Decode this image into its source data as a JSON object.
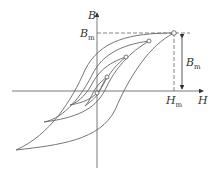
{
  "diagram": {
    "type": "nested hysteresis loops (B-H curve)",
    "axes": {
      "x_label": "H",
      "y_label": "B"
    },
    "labels": {
      "B": "B",
      "H": "H",
      "Bm_left": "B",
      "Bm_left_sub": "m",
      "Bm_right": "B",
      "Bm_right_sub": "m",
      "Hm": "H",
      "Hm_sub": "m"
    },
    "colors": {
      "stroke": "#555555",
      "text": "#333333"
    },
    "loop_tips": [
      [
        174,
        33
      ],
      [
        149,
        41
      ],
      [
        126,
        57
      ],
      [
        107,
        77
      ],
      [
        97,
        93
      ]
    ]
  }
}
